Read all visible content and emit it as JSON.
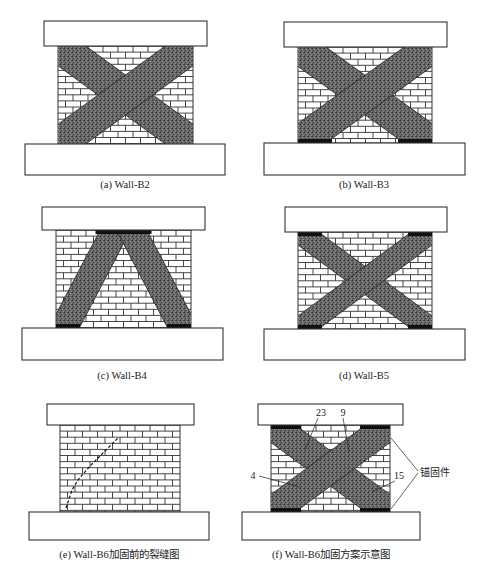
{
  "figure": {
    "panels": [
      {
        "id": "a",
        "caption": "(a) Wall-B2",
        "strips": "x-full",
        "anchors": "none"
      },
      {
        "id": "b",
        "caption": "(b) Wall-B3",
        "strips": "x-full",
        "anchors": "bottom-corners"
      },
      {
        "id": "c",
        "caption": "(c) Wall-B4",
        "strips": "inverted-v",
        "anchors": "top-center-and-bottom-corners"
      },
      {
        "id": "d",
        "caption": "(d) Wall-B5",
        "strips": "x-narrow",
        "anchors": "all-corners"
      },
      {
        "id": "e",
        "caption": "(e) Wall-B6加固前的裂缝图",
        "strips": "none",
        "anchors": "none",
        "crack": "diagonal-dashed"
      },
      {
        "id": "f",
        "caption": "(f) Wall-B6加固方案示意图",
        "strips": "x-full",
        "anchors": "all-corners",
        "callouts": [
          "23",
          "9",
          "4",
          "15"
        ],
        "anchor_label": "锚固件"
      }
    ]
  },
  "colors": {
    "line": "#333333",
    "brick_fill": "#ffffff",
    "strip_fill": "#5a5a5a",
    "anchor_fill": "#111111",
    "background": "#ffffff"
  }
}
